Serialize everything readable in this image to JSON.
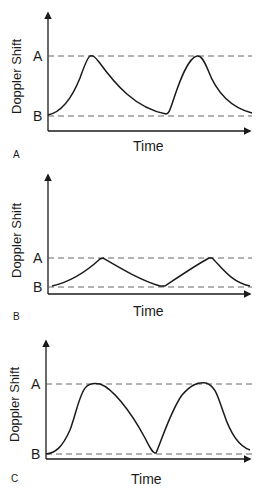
{
  "figure": {
    "panels": [
      {
        "id": "A",
        "panel_label": "A",
        "ylabel": "Doppler Shift",
        "xlabel": "Time",
        "level_top_label": "A",
        "level_bottom_label": "B",
        "description": "Large Doppler shift peaks reaching level A, slow decay to level B"
      },
      {
        "id": "B",
        "panel_label": "B",
        "ylabel": "Doppler Shift",
        "xlabel": "Time",
        "level_top_label": "A",
        "level_bottom_label": "B",
        "description": "Small triangular Doppler shift peaks, level A close to level B"
      },
      {
        "id": "C",
        "panel_label": "C",
        "ylabel": "Doppler Shift",
        "xlabel": "Time",
        "level_top_label": "A",
        "level_bottom_label": "B",
        "description": "Large rounded Doppler shift peaks, wide separation between A and B"
      }
    ],
    "colors": {
      "line": "#1a1a1a",
      "dashed": "#555555",
      "background": "#ffffff"
    }
  }
}
